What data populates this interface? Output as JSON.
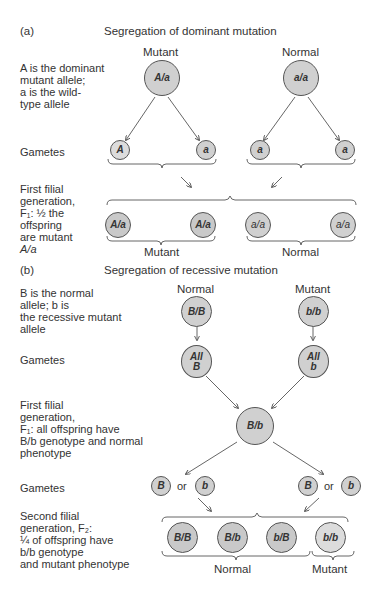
{
  "panel_a": {
    "tag": "(a)",
    "title": "Segregation of dominant mutation",
    "desc_lines": [
      "A is the dominant",
      "mutant allele;",
      "a is the wild-",
      "type allele"
    ],
    "parents": [
      {
        "label": "Mutant",
        "genotype": "A/a"
      },
      {
        "label": "Normal",
        "genotype": "a/a"
      }
    ],
    "gametes_label": "Gametes",
    "gametes": [
      "A",
      "a",
      "a",
      "a"
    ],
    "f1_desc_lines": [
      "First filial",
      "generation,",
      "F₁: ½ the",
      "offspring",
      "are mutant",
      "A/a"
    ],
    "f1": [
      "A/a",
      "A/a",
      "a/a",
      "a/a"
    ],
    "f1_groups": [
      "Mutant",
      "Normal"
    ]
  },
  "panel_b": {
    "tag": "(b)",
    "title": "Segregation of recessive mutation",
    "desc_lines": [
      "B is the normal",
      "allele; b is",
      "the recessive mutant",
      "allele"
    ],
    "parents": [
      {
        "label": "Normal",
        "genotype": "B/B"
      },
      {
        "label": "Mutant",
        "genotype": "b/b"
      }
    ],
    "gametes_label": "Gametes",
    "gametes": [
      {
        "line1": "All",
        "line2": "B"
      },
      {
        "line1": "All",
        "line2": "b"
      }
    ],
    "f1_desc_lines": [
      "First filial",
      "generation,",
      "F₁: all offspring have",
      "B/b genotype and normal",
      "phenotype"
    ],
    "f1": "B/b",
    "gametes2_label": "Gametes",
    "gametes2": [
      "B",
      "b",
      "B",
      "b"
    ],
    "or_text": "or",
    "f2_desc_lines": [
      "Second filial",
      "generation, F₂:",
      "¼ of offspring have",
      "b/b genotype",
      "and mutant phenotype"
    ],
    "f2": [
      "B/B",
      "B/b",
      "b/B",
      "b/b"
    ],
    "f2_groups": [
      "Normal",
      "Mutant"
    ]
  }
}
